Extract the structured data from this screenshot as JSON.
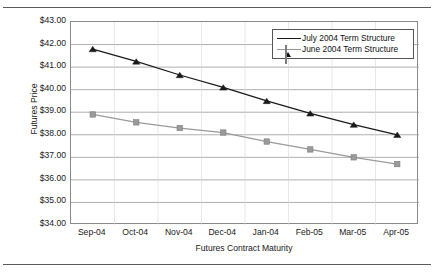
{
  "figure": {
    "title": "Exhibit 3 — Term Structure for Crude Oil Futures"
  },
  "chart_data": {
    "type": "line",
    "title": "Exhibit 3 — Term Structure for Crude Oil Futures",
    "xlabel": "Futures Contract Maturity",
    "ylabel": "Futures Price",
    "categories": [
      "Sep-04",
      "Oct-04",
      "Nov-04",
      "Dec-04",
      "Jan-04",
      "Feb-05",
      "Mar-05",
      "Apr-05"
    ],
    "ylim": [
      34.0,
      43.0
    ],
    "ytick_step": 1.0,
    "ytick_labels": [
      "$43.00",
      "$42.00",
      "$41.00",
      "$40.00",
      "$39.00",
      "$38.00",
      "$37.00",
      "$36.00",
      "$35.00",
      "$34.00"
    ],
    "ytick_values": [
      43.0,
      42.0,
      41.0,
      40.0,
      39.0,
      38.0,
      37.0,
      36.0,
      35.0,
      34.0
    ],
    "grid": "horizontal",
    "legend_position": "top-right",
    "series": [
      {
        "name": "July 2004 Term Structure",
        "marker": "triangle",
        "color": "#1a1a1a",
        "values": [
          41.8,
          41.25,
          40.65,
          40.1,
          39.5,
          38.95,
          38.45,
          38.0
        ]
      },
      {
        "name": "June 2004 Term Structure",
        "marker": "square",
        "color": "#9a9a9a",
        "values": [
          38.9,
          38.55,
          38.3,
          38.1,
          37.7,
          37.35,
          37.0,
          36.7
        ]
      }
    ]
  },
  "legend": {
    "items": [
      {
        "label": "July 2004 Term Structure"
      },
      {
        "label": "June 2004 Term Structure"
      }
    ]
  }
}
